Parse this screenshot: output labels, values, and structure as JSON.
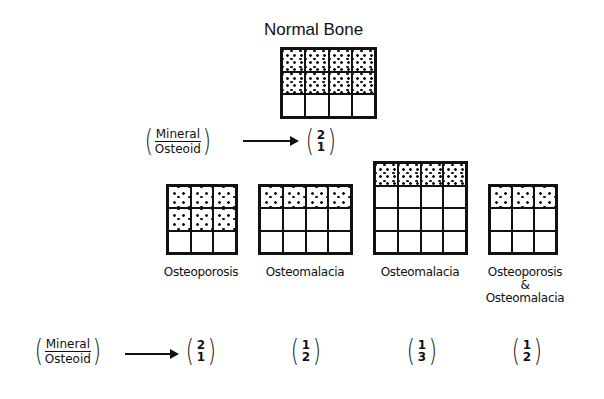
{
  "title": "Normal Bone",
  "ratio_label": {
    "numerator": "Mineral",
    "denominator": "Osteoid"
  },
  "normal": {
    "ratio": {
      "num": "2",
      "den": "1"
    },
    "cols": 4,
    "rows": 3,
    "mineral_rows": 2
  },
  "conditions": [
    {
      "label": "Osteoporosis",
      "cols": 3,
      "rows": 3,
      "mineral_rows": 2,
      "ratio": {
        "num": "2",
        "den": "1"
      }
    },
    {
      "label": "Osteomalacia",
      "cols": 4,
      "rows": 3,
      "mineral_rows": 1,
      "ratio": {
        "num": "1",
        "den": "2"
      }
    },
    {
      "label": "Osteomalacia",
      "cols": 4,
      "rows": 4,
      "mineral_rows": 1,
      "ratio": {
        "num": "1",
        "den": "3"
      }
    },
    {
      "label": "Osteoporosis",
      "label_amp": "&",
      "label_line3": "Osteomalacia",
      "cols": 3,
      "rows": 3,
      "mineral_rows": 1,
      "ratio": {
        "num": "1",
        "den": "2"
      }
    }
  ]
}
